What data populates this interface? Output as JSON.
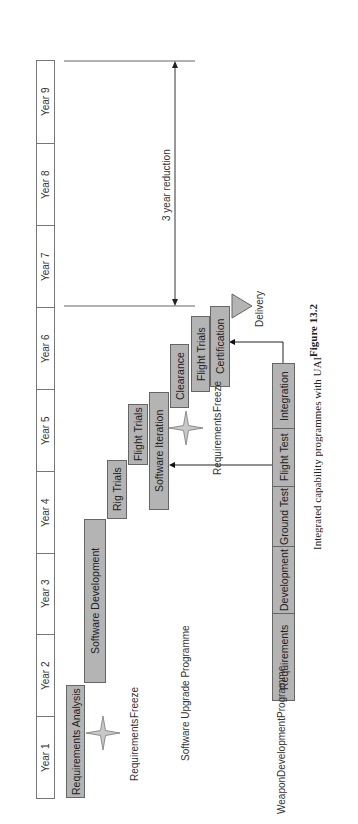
{
  "figure": {
    "number": "Figure 13.2",
    "title": "Integrated capability programmes with UAI"
  },
  "timeline": {
    "years": [
      "Year 1",
      "Year 2",
      "Year 3",
      "Year 4",
      "Year 5",
      "Year 6",
      "Year 7",
      "Year 8",
      "Year 9"
    ]
  },
  "software_upgrade": {
    "label": "Software Upgrade Programme",
    "tasks": [
      {
        "name": "Requirements Analysis"
      },
      {
        "name": "Software Development"
      },
      {
        "name": "Rig Trials"
      },
      {
        "name": "Flight Trials"
      },
      {
        "name": "Software Iteration"
      },
      {
        "name": "Clearance"
      },
      {
        "name": "Flight Trials"
      },
      {
        "name": "Certification"
      }
    ],
    "milestones": [
      {
        "name": "Requirements Freeze",
        "line1": "Requirements",
        "line2": "Freeze"
      },
      {
        "name": "Requirements Freeze",
        "line1": "Requirements",
        "line2": "Freeze"
      },
      {
        "name": "Delivery"
      }
    ]
  },
  "weapon_development": {
    "label_line1": "Weapon",
    "label_line2": "Development",
    "label_line3": "Programme",
    "phases": [
      "Requirements",
      "Development",
      "Ground Test",
      "Flight Test",
      "Integration"
    ]
  },
  "annotation": {
    "reduction": "3 year reduction"
  },
  "colors": {
    "bar_fill": "#b4b4b4",
    "bar_border": "#666666",
    "line": "#333333"
  }
}
